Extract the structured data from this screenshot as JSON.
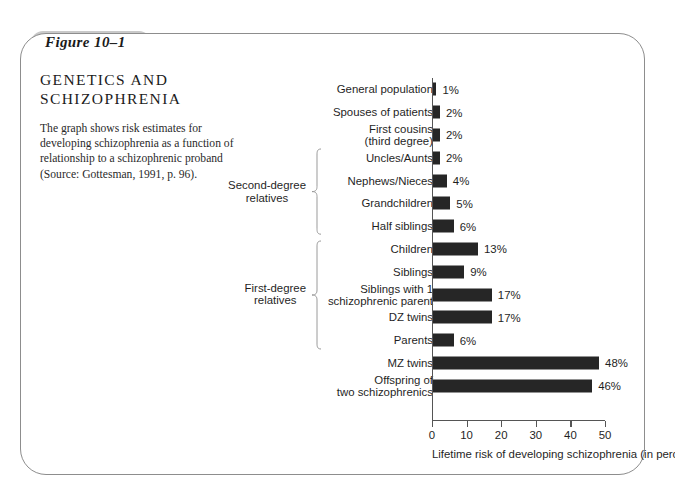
{
  "figure": {
    "tab_label": "Figure 10–1",
    "caption": "The graph shows risk estimates for developing schizophrenia as a function of relationship to a schizophrenic proband (Source: Gottesman, 1991, p. 96)."
  },
  "groups": [
    {
      "label": "Second-degree relatives",
      "start_index": 3,
      "end_index": 6
    },
    {
      "label": "First-degree relatives",
      "start_index": 7,
      "end_index": 11
    }
  ],
  "chart_data": {
    "type": "bar",
    "orientation": "horizontal",
    "xlabel": "Lifetime risk of developing schizophrenia (in percents)",
    "ylabel": "",
    "xlim": [
      0,
      50
    ],
    "xticks": [
      0,
      10,
      20,
      30,
      40,
      50
    ],
    "xtick_labels": [
      "0",
      "10",
      "20",
      "30",
      "40",
      "50"
    ],
    "grid": false,
    "legend": false,
    "bar_color": "#262626",
    "value_suffix": "%",
    "categories": [
      "General population",
      "Spouses of patients",
      "First cousins\n(third degree)",
      "Uncles/Aunts",
      "Nephews/Nieces",
      "Grandchildren",
      "Half siblings",
      "Children",
      "Siblings",
      "Siblings with 1\nschizophrenic parent",
      "DZ twins",
      "Parents",
      "MZ twins",
      "Offspring of\ntwo schizophrenics"
    ],
    "values": [
      1,
      2,
      2,
      2,
      4,
      5,
      6,
      13,
      9,
      17,
      17,
      6,
      48,
      46
    ],
    "value_labels": [
      "1%",
      "2%",
      "2%",
      "2%",
      "4%",
      "5%",
      "6%",
      "13%",
      "9%",
      "17%",
      "17%",
      "6%",
      "48%",
      "46%"
    ]
  }
}
